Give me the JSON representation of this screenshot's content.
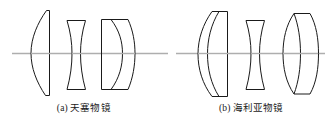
{
  "figure": {
    "kind": "optical-lens-cross-section-diagram",
    "background_color": "#ffffff",
    "line_color": "#1a1a1a",
    "axis_color": "#aeaeae",
    "width": 335,
    "height": 123
  },
  "panels": [
    {
      "id": "panel-a",
      "label": "(a)",
      "title": "天塞物镜",
      "caption": "(a) 天塞物镜",
      "axis": {
        "y": 53,
        "x_start": 12,
        "x_end": 168
      },
      "groups": [
        {
          "name": "front-element",
          "type": "plano-convex",
          "element_count": 1,
          "x_left": 30,
          "x_right": 50,
          "y_top": 10,
          "y_bottom": 95
        },
        {
          "name": "middle-element",
          "type": "biconcave",
          "element_count": 1,
          "x_left": 66,
          "x_right": 86,
          "y_top": 20,
          "y_bottom": 90
        },
        {
          "name": "rear-doublet",
          "type": "cemented-doublet",
          "element_count": 2,
          "x_left": 101,
          "x_right": 135,
          "y_top": 19,
          "y_bottom": 90
        }
      ]
    },
    {
      "id": "panel-b",
      "label": "(b)",
      "title": "海利亚物镜",
      "caption": "(b) 海利亚物镜",
      "axis": {
        "y": 53,
        "x_start": 176,
        "x_end": 325
      },
      "groups": [
        {
          "name": "front-doublet",
          "type": "cemented-doublet",
          "element_count": 2,
          "x_left": 198,
          "x_right": 228,
          "y_top": 11,
          "y_bottom": 96
        },
        {
          "name": "middle-element",
          "type": "biconcave",
          "element_count": 1,
          "x_left": 245,
          "x_right": 265,
          "y_top": 20,
          "y_bottom": 90
        },
        {
          "name": "rear-doublet",
          "type": "cemented-doublet",
          "element_count": 2,
          "x_left": 283,
          "x_right": 318,
          "y_top": 13,
          "y_bottom": 94
        }
      ]
    }
  ]
}
